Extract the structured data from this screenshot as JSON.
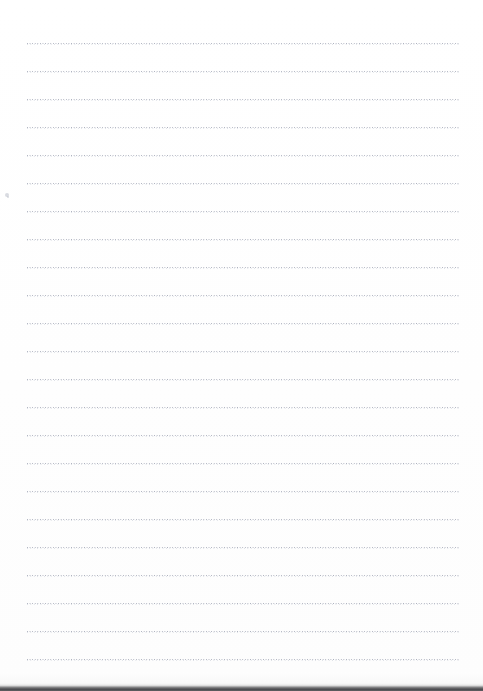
{
  "document": {
    "type": "scanned-lined-notepaper",
    "title": "Blank lined notepaper scan",
    "content_text": "",
    "page_width": 483,
    "page_height": 691,
    "background_color": "#ffffff",
    "rule_color": "#969cac",
    "rule_secondary_color": "#b0b6c4",
    "rule_style": "dotted",
    "rule_count": 23,
    "rule_first_y": 43,
    "rule_spacing": 28,
    "rule_left_x": 27,
    "rule_right_x": 459,
    "rule_thickness": 3,
    "margins": {
      "left": 27,
      "right": 24,
      "top": 43,
      "bottom": 28
    }
  },
  "rules": [
    {
      "y": 43,
      "left": 27,
      "width": 432
    },
    {
      "y": 71,
      "left": 27,
      "width": 432
    },
    {
      "y": 99,
      "left": 27,
      "width": 432
    },
    {
      "y": 127,
      "left": 27,
      "width": 432
    },
    {
      "y": 155,
      "left": 27,
      "width": 432
    },
    {
      "y": 183,
      "left": 27,
      "width": 432
    },
    {
      "y": 211,
      "left": 27,
      "width": 432
    },
    {
      "y": 239,
      "left": 27,
      "width": 432
    },
    {
      "y": 267,
      "left": 27,
      "width": 432
    },
    {
      "y": 295,
      "left": 27,
      "width": 432
    },
    {
      "y": 323,
      "left": 27,
      "width": 432
    },
    {
      "y": 351,
      "left": 27,
      "width": 432
    },
    {
      "y": 379,
      "left": 27,
      "width": 432
    },
    {
      "y": 407,
      "left": 27,
      "width": 432
    },
    {
      "y": 435,
      "left": 27,
      "width": 432
    },
    {
      "y": 463,
      "left": 27,
      "width": 432
    },
    {
      "y": 491,
      "left": 27,
      "width": 432
    },
    {
      "y": 519,
      "left": 27,
      "width": 432
    },
    {
      "y": 547,
      "left": 27,
      "width": 432
    },
    {
      "y": 575,
      "left": 27,
      "width": 432
    },
    {
      "y": 603,
      "left": 27,
      "width": 432
    },
    {
      "y": 631,
      "left": 27,
      "width": 432
    },
    {
      "y": 659,
      "left": 27,
      "width": 432
    }
  ],
  "scan_edge": {
    "label": "scanner-bottom-edge",
    "y": 683,
    "height": 8,
    "color": "#4a4a4e"
  },
  "specks": [
    {
      "x": 5,
      "y": 193,
      "size": 4
    },
    {
      "x": 7,
      "y": 196,
      "size": 2
    }
  ]
}
